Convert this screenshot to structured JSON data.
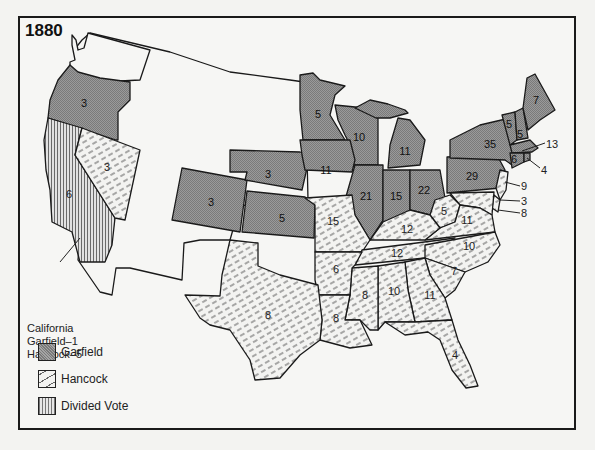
{
  "map": {
    "title": "1880",
    "colors": {
      "garfield": "#8d8d8d",
      "hancock_bg": "#f3f3f1",
      "hancock_hatch": "#555555",
      "divided": "#cfcfcf",
      "border": "#1a1a1a",
      "background": "#f6f6f4"
    },
    "legend": [
      {
        "key": "garfield",
        "label": "Garfield"
      },
      {
        "key": "hancock",
        "label": "Hancock"
      },
      {
        "key": "divided",
        "label": "Divided Vote"
      }
    ],
    "california_note": {
      "line1": "California",
      "line2": "Garfield–1",
      "line3": "Hancock–5"
    },
    "states": [
      {
        "name": "Oregon",
        "votes": "3",
        "winner": "garfield"
      },
      {
        "name": "California",
        "votes": "6",
        "winner": "divided"
      },
      {
        "name": "Nevada",
        "votes": "3",
        "winner": "hancock"
      },
      {
        "name": "Colorado",
        "votes": "3",
        "winner": "garfield"
      },
      {
        "name": "Nebraska",
        "votes": "3",
        "winner": "garfield"
      },
      {
        "name": "Kansas",
        "votes": "5",
        "winner": "garfield"
      },
      {
        "name": "Minnesota",
        "votes": "5",
        "winner": "garfield"
      },
      {
        "name": "Iowa",
        "votes": "11",
        "winner": "garfield"
      },
      {
        "name": "Wisconsin",
        "votes": "10",
        "winner": "garfield"
      },
      {
        "name": "Michigan",
        "votes": "11",
        "winner": "garfield"
      },
      {
        "name": "Illinois",
        "votes": "21",
        "winner": "garfield"
      },
      {
        "name": "Indiana",
        "votes": "15",
        "winner": "garfield"
      },
      {
        "name": "Ohio",
        "votes": "22",
        "winner": "garfield"
      },
      {
        "name": "Pennsylvania",
        "votes": "29",
        "winner": "garfield"
      },
      {
        "name": "New York",
        "votes": "35",
        "winner": "garfield"
      },
      {
        "name": "Vermont",
        "votes": "5",
        "winner": "garfield"
      },
      {
        "name": "New Hampshire",
        "votes": "5",
        "winner": "garfield"
      },
      {
        "name": "Maine",
        "votes": "7",
        "winner": "garfield"
      },
      {
        "name": "Massachusetts",
        "votes": "13",
        "winner": "garfield"
      },
      {
        "name": "Connecticut",
        "votes": "6",
        "winner": "garfield"
      },
      {
        "name": "Rhode Island",
        "votes": "4",
        "winner": "garfield"
      },
      {
        "name": "New Jersey",
        "votes": "9",
        "winner": "hancock"
      },
      {
        "name": "Delaware",
        "votes": "3",
        "winner": "hancock"
      },
      {
        "name": "Maryland",
        "votes": "8",
        "winner": "hancock"
      },
      {
        "name": "Missouri",
        "votes": "15",
        "winner": "hancock"
      },
      {
        "name": "Kentucky",
        "votes": "12",
        "winner": "hancock"
      },
      {
        "name": "West Virginia",
        "votes": "5",
        "winner": "hancock"
      },
      {
        "name": "Virginia",
        "votes": "11",
        "winner": "hancock"
      },
      {
        "name": "Tennessee",
        "votes": "12",
        "winner": "hancock"
      },
      {
        "name": "North Carolina",
        "votes": "10",
        "winner": "hancock"
      },
      {
        "name": "South Carolina",
        "votes": "7",
        "winner": "hancock"
      },
      {
        "name": "Georgia",
        "votes": "11",
        "winner": "hancock"
      },
      {
        "name": "Alabama",
        "votes": "10",
        "winner": "hancock"
      },
      {
        "name": "Mississippi",
        "votes": "8",
        "winner": "hancock"
      },
      {
        "name": "Louisiana",
        "votes": "8",
        "winner": "hancock"
      },
      {
        "name": "Arkansas",
        "votes": "6",
        "winner": "hancock"
      },
      {
        "name": "Texas",
        "votes": "8",
        "winner": "hancock"
      },
      {
        "name": "Florida",
        "votes": "4",
        "winner": "hancock"
      }
    ]
  }
}
